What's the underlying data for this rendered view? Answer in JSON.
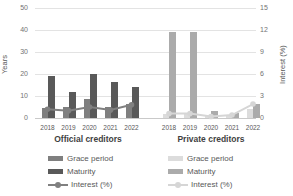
{
  "chart_data": {
    "type": "bar",
    "title": "",
    "left_axis": {
      "label": "Years",
      "min": 0,
      "max": 50,
      "ticks": [
        0,
        10,
        20,
        30,
        40,
        50
      ]
    },
    "right_axis": {
      "label": "Interest (%)",
      "min": 0,
      "max": 15,
      "ticks": [
        0,
        3,
        6,
        9,
        12,
        15
      ]
    },
    "categories": [
      "2018",
      "2019",
      "2020",
      "2021",
      "2022"
    ],
    "grid": true,
    "legend_position": "bottom",
    "groups": [
      {
        "name": "Official creditors",
        "series": [
          {
            "name": "Grace period",
            "type": "bar",
            "axis": "left",
            "color": "#7f7f7f",
            "values": [
              4.5,
              5,
              8.5,
              5,
              6.5
            ]
          },
          {
            "name": "Maturity",
            "type": "bar",
            "axis": "left",
            "color": "#595959",
            "values": [
              19,
              12,
              20,
              16.5,
              14
            ]
          },
          {
            "name": "Interest (%)",
            "type": "line",
            "axis": "right",
            "color": "#808080",
            "values": [
              1.2,
              1.0,
              1.5,
              1.1,
              1.8
            ]
          }
        ]
      },
      {
        "name": "Private creditors",
        "series": [
          {
            "name": "Grace period",
            "type": "bar",
            "axis": "left",
            "color": "#dcdcdc",
            "values": [
              2,
              2,
              1,
              1.5,
              4
            ]
          },
          {
            "name": "Maturity",
            "type": "bar",
            "axis": "left",
            "color": "#ababab",
            "values": [
              39,
              39,
              3,
              2.5,
              6.5
            ]
          },
          {
            "name": "Interest (%)",
            "type": "line",
            "axis": "right",
            "color": "#d6d6d6",
            "values": [
              0.6,
              0.6,
              0.2,
              0.4,
              1.9
            ]
          }
        ]
      }
    ]
  }
}
